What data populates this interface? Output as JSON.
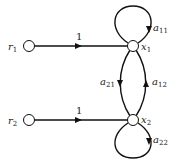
{
  "diagram": {
    "type": "signal-flow-graph",
    "nodes": [
      {
        "id": "r1",
        "label": "r",
        "subscript": "1"
      },
      {
        "id": "r2",
        "label": "r",
        "subscript": "2"
      },
      {
        "id": "x1",
        "label": "x",
        "subscript": "1"
      },
      {
        "id": "x2",
        "label": "x",
        "subscript": "2"
      }
    ],
    "edges": [
      {
        "from": "r1",
        "to": "x1",
        "gain": "1"
      },
      {
        "from": "r2",
        "to": "x2",
        "gain": "1"
      },
      {
        "from": "x1",
        "to": "x1",
        "gain_label": "a",
        "gain_subscript": "11"
      },
      {
        "from": "x2",
        "to": "x2",
        "gain_label": "a",
        "gain_subscript": "22"
      },
      {
        "from": "x1",
        "to": "x2",
        "gain_label": "a",
        "gain_subscript": "21"
      },
      {
        "from": "x2",
        "to": "x1",
        "gain_label": "a",
        "gain_subscript": "12"
      }
    ]
  }
}
